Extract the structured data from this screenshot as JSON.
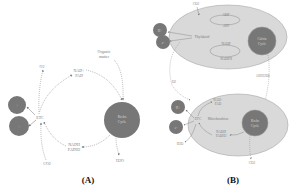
{
  "colors": {
    "background": "#ffffff",
    "dark_circle": "#757575",
    "organelle_fill": "#d9d9d9",
    "organelle_stroke": "#a8a8a8",
    "arrow": "#8a8a8a",
    "label": "#7a7a7a",
    "caption": "#111111"
  },
  "panel_a": {
    "caption": "(A)",
    "nodes": {
      "o2": "O2",
      "nad_fad": [
        "NAD+",
        "FAD"
      ],
      "organic_matter": [
        "Organic",
        "matter"
      ],
      "etc": "ETC",
      "nadh_fadh": [
        "NADH",
        "FADH2"
      ],
      "co2": "CO2",
      "h2o": "H2O",
      "krebs_cycle": [
        "Krebs",
        "Cycle"
      ],
      "atp_circle_1": "+",
      "atp_circle_2": "+"
    }
  },
  "panel_b": {
    "caption": "(B)",
    "chloroplast": {
      "label": "Thylakoid",
      "co2_in": "CO2",
      "adp": "ADP",
      "atp": "ATP",
      "nadp": "NADP",
      "nadph": "NADPH",
      "calvin_cycle": [
        "Calvin",
        "Cycle"
      ],
      "sugar_out": "C6H12O6",
      "o2_out": "O2",
      "circle_1": "H+",
      "circle_2": "e-"
    },
    "mitochondrion": {
      "label": "Mitochondrion",
      "nad_fad": [
        "NAD+",
        "FAD"
      ],
      "etc": "ETC",
      "nadh_fadh": [
        "NADH",
        "FADH2"
      ],
      "krebs_cycle": [
        "Krebs",
        "Cycle"
      ],
      "h2o_out": "H2O",
      "co2_out": "CO2",
      "circle_1": "H+",
      "circle_2": "e-"
    }
  }
}
